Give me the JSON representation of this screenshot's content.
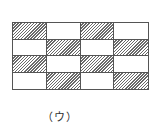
{
  "figure": {
    "caption": "（ウ）",
    "grid": {
      "rows": 4,
      "cols": 4,
      "pattern": [
        [
          "hatched",
          "blank",
          "hatched",
          "blank"
        ],
        [
          "blank",
          "hatched",
          "blank",
          "hatched"
        ],
        [
          "hatched",
          "blank",
          "hatched",
          "blank"
        ],
        [
          "blank",
          "hatched",
          "blank",
          "hatched"
        ]
      ]
    },
    "colors": {
      "line": "#555555",
      "hatch": "#6a6a6a",
      "background": "#ffffff"
    }
  }
}
